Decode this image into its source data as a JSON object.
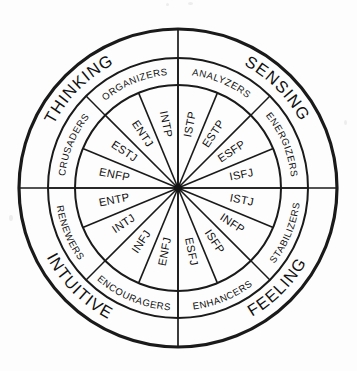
{
  "diagram": {
    "center": {
      "x": 178,
      "y": 188
    },
    "radii": {
      "outer": 159,
      "middle": 130,
      "inner": 103,
      "hub": 4
    },
    "colors": {
      "background": "#fdfdfd",
      "stroke": "#1a1a1a",
      "text": "#101010"
    },
    "axes": [
      {
        "name": "vertical-axis",
        "orientation": "vertical"
      },
      {
        "name": "horizontal-axis",
        "orientation": "horizontal"
      }
    ],
    "quadrants": [
      {
        "label": "THINKING",
        "position": "upper-left",
        "mid_angle_deg": 225
      },
      {
        "label": "SENSING",
        "position": "upper-right",
        "mid_angle_deg": 315
      },
      {
        "label": "FEELING",
        "position": "lower-right",
        "mid_angle_deg": 45
      },
      {
        "label": "INTUITIVE",
        "position": "lower-left",
        "mid_angle_deg": 135
      }
    ],
    "groups": [
      {
        "label": "ANALYZERS",
        "start_angle_deg": 270,
        "end_angle_deg": 315,
        "types": [
          "ISTP",
          "INTP"
        ]
      },
      {
        "label": "ENERGIZERS",
        "start_angle_deg": 315,
        "end_angle_deg": 360,
        "types": [
          "ESTP",
          "ESFP"
        ]
      },
      {
        "label": "STABILIZERS",
        "start_angle_deg": 0,
        "end_angle_deg": 45,
        "types": [
          "ISFJ",
          "ISTJ"
        ]
      },
      {
        "label": "ENHANCERS",
        "start_angle_deg": 45,
        "end_angle_deg": 90,
        "types": [
          "INFP",
          "ISFP"
        ]
      },
      {
        "label": "ENCOURAGERS",
        "start_angle_deg": 90,
        "end_angle_deg": 135,
        "types": [
          "ESFJ",
          "ENFJ"
        ]
      },
      {
        "label": "RENEWERS",
        "start_angle_deg": 135,
        "end_angle_deg": 180,
        "types": [
          "INFJ",
          "INTJ"
        ]
      },
      {
        "label": "CRUSADERS",
        "start_angle_deg": 180,
        "end_angle_deg": 225,
        "types": [
          "ENTP",
          "ENFP"
        ]
      },
      {
        "label": "ORGANIZERS",
        "start_angle_deg": 225,
        "end_angle_deg": 270,
        "types": [
          "ESTJ",
          "ENTJ"
        ]
      }
    ],
    "types": [
      {
        "label": "ISTP",
        "mid_angle_deg": 281.25
      },
      {
        "label": "ESTP",
        "mid_angle_deg": 303.75
      },
      {
        "label": "ESFP",
        "mid_angle_deg": 326.25
      },
      {
        "label": "ISFJ",
        "mid_angle_deg": 348.75
      },
      {
        "label": "ISTJ",
        "mid_angle_deg": 11.25
      },
      {
        "label": "INFP",
        "mid_angle_deg": 33.75
      },
      {
        "label": "ISFP",
        "mid_angle_deg": 56.25
      },
      {
        "label": "ESFJ",
        "mid_angle_deg": 78.75
      },
      {
        "label": "ENFJ",
        "mid_angle_deg": 101.25
      },
      {
        "label": "INFJ",
        "mid_angle_deg": 123.75
      },
      {
        "label": "INTJ",
        "mid_angle_deg": 146.25
      },
      {
        "label": "ENTP",
        "mid_angle_deg": 168.75
      },
      {
        "label": "ENFP",
        "mid_angle_deg": 191.25
      },
      {
        "label": "ESTJ",
        "mid_angle_deg": 213.75
      },
      {
        "label": "ENTJ",
        "mid_angle_deg": 236.25
      },
      {
        "label": "INTP",
        "mid_angle_deg": 258.75
      }
    ]
  }
}
